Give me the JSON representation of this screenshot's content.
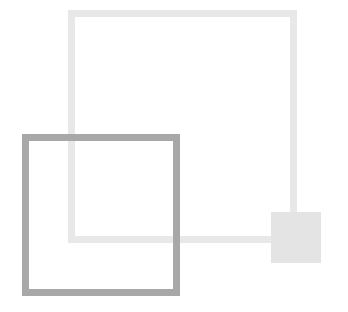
{
  "diagram": {
    "shapes": [
      {
        "id": "light-square",
        "type": "outlined-square",
        "color": "#e8e8e8",
        "x": 68,
        "y": 10,
        "width": 229,
        "height": 233,
        "stroke": 7
      },
      {
        "id": "dark-square",
        "type": "outlined-square",
        "color": "#a8a8a8",
        "x": 22,
        "y": 134,
        "width": 158,
        "height": 162,
        "stroke": 7
      },
      {
        "id": "small-square",
        "type": "filled-square",
        "color": "#e4e4e4",
        "x": 271,
        "y": 212,
        "width": 50,
        "height": 51
      }
    ]
  }
}
